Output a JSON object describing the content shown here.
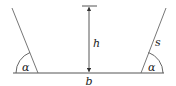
{
  "diagram": {
    "type": "trapezoidal-channel-cross-section",
    "stroke_color": "#555555",
    "labels": {
      "left_angle": "α",
      "right_angle": "α",
      "height": "h",
      "side": "s",
      "base": "b"
    },
    "geometry": {
      "baseline": {
        "x1": 13,
        "y1": 73,
        "x2": 164,
        "y2": 73
      },
      "left_side": {
        "x1": 38,
        "y1": 73,
        "x2": 12,
        "y2": 8
      },
      "right_side": {
        "x1": 141,
        "y1": 73,
        "x2": 166,
        "y2": 8
      },
      "height_arrow": {
        "x": 89,
        "y_top": 6,
        "y_bottom": 73
      },
      "height_tick": {
        "x1": 82,
        "x2": 97,
        "y": 6
      }
    }
  }
}
